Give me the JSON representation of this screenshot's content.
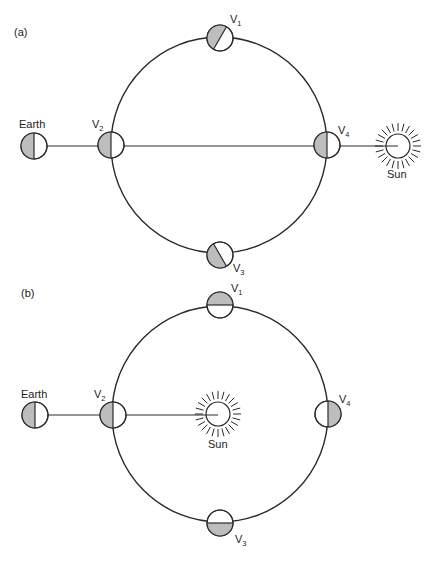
{
  "panels": {
    "a": {
      "label": "(a)",
      "earth_label": "Earth",
      "sun_label": "Sun",
      "venus_positions": [
        {
          "letter": "V",
          "sub": "1",
          "position": "top",
          "phase": "diagonal, left shaded"
        },
        {
          "letter": "V",
          "sub": "2",
          "position": "left",
          "phase": "left half shaded"
        },
        {
          "letter": "V",
          "sub": "3",
          "position": "bottom",
          "phase": "diagonal, left shaded"
        },
        {
          "letter": "V",
          "sub": "4",
          "position": "right",
          "phase": "left half shaded"
        }
      ]
    },
    "b": {
      "label": "(b)",
      "earth_label": "Earth",
      "sun_label": "Sun",
      "venus_positions": [
        {
          "letter": "V",
          "sub": "1",
          "position": "top",
          "phase": "top half shaded"
        },
        {
          "letter": "V",
          "sub": "2",
          "position": "left",
          "phase": "left half shaded"
        },
        {
          "letter": "V",
          "sub": "3",
          "position": "bottom",
          "phase": "bottom half shaded"
        },
        {
          "letter": "V",
          "sub": "4",
          "position": "right",
          "phase": "right half shaded"
        }
      ]
    }
  },
  "colors": {
    "shade": "#bdbdbd",
    "stroke": "#2a2a2a",
    "background": "#ffffff"
  }
}
